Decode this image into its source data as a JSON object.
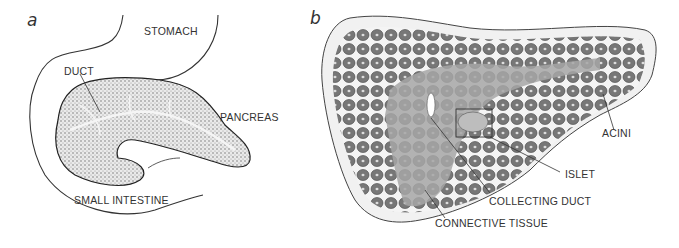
{
  "figure": {
    "panels": [
      {
        "letter": "a",
        "labels": {
          "stomach": "STOMACH",
          "duct": "DUCT",
          "pancreas": "PANCREAS",
          "small_intestine": "SMALL INTESTINE"
        }
      },
      {
        "letter": "b",
        "labels": {
          "acini": "ACINI",
          "islet": "ISLET",
          "collecting_duct": "COLLECTING DUCT",
          "connective_tissue": "CONNECTIVE TISSUE"
        }
      }
    ],
    "colors": {
      "line": "#333333",
      "stipple_light": "#cfcfcf",
      "stipple_dark": "#6e6e6e",
      "tissue_gray": "#a8a8a8",
      "acinus_fill": "#7a7a7a",
      "background": "#ffffff"
    }
  }
}
